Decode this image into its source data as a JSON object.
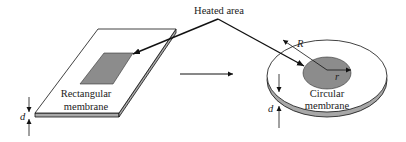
{
  "diagram": {
    "heated_area_label": "Heated area",
    "rect_label_line1": "Rectangular",
    "rect_label_line2": "membrane",
    "circ_label_line1": "Circular",
    "circ_label_line2": "membrane",
    "thickness_symbol": "d",
    "outer_radius_symbol": "R",
    "inner_radius_symbol": "r",
    "colors": {
      "heated_fill": "#8c8c8c",
      "edge_fill": "#a8a8a8",
      "line": "#111111"
    }
  }
}
